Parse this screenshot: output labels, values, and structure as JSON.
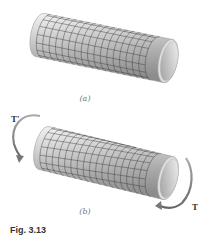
{
  "figure": {
    "caption": "Fig. 3.13",
    "panels": [
      {
        "id": "a",
        "label": "(a)",
        "description": "Unloaded circular shaft with rectangular grid on surface"
      },
      {
        "id": "b",
        "label": "(b)",
        "description": "Shaft under torsion; grid lines deformed into parallelograms"
      }
    ],
    "torques": {
      "left": "T'",
      "right": "T"
    },
    "colors": {
      "shaft_light": "#e8e8e8",
      "shaft_dark": "#8a8a8a",
      "grid": "#3a3a3a",
      "arrow": "#888888"
    }
  }
}
